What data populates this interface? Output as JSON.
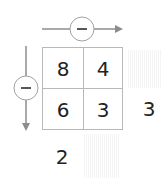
{
  "diagram": {
    "operator_top": "−",
    "operator_left": "−",
    "grid": [
      [
        "8",
        "4"
      ],
      [
        "6",
        "3"
      ]
    ],
    "row_result": {
      "row": 2,
      "value": "3"
    },
    "col_result": {
      "col": 1,
      "value": "2"
    },
    "blank_results": [
      "row-1-result",
      "col-2-result"
    ],
    "colors": {
      "line": "#8c8c8c",
      "circle": "#a0a0a0",
      "grid_border": "#b8b8b8",
      "text": "#222222",
      "hatch": "#f2f2f2"
    }
  }
}
